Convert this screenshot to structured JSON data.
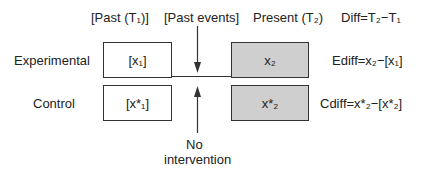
{
  "headers": {
    "past": "[Past (T₁)]",
    "past_events": "[Past events]",
    "present": "Present (T₂)",
    "diff": "Diff=T₂−T₁"
  },
  "rows": [
    {
      "label": "Experimental",
      "past_value": "[x₁]",
      "present_value": "x₂",
      "diff_formula": "Ediff=x₂−[x₁]"
    },
    {
      "label": "Control",
      "past_value": "[x*₁]",
      "present_value": "x*₂",
      "diff_formula": "Cdiff=x*₂−[x*₂]"
    }
  ],
  "annotation": {
    "line1": "No",
    "line2": "intervention"
  },
  "colors": {
    "present_box_fill": "#cfcfcf",
    "past_box_fill": "#ffffff",
    "stroke": "#333333"
  }
}
